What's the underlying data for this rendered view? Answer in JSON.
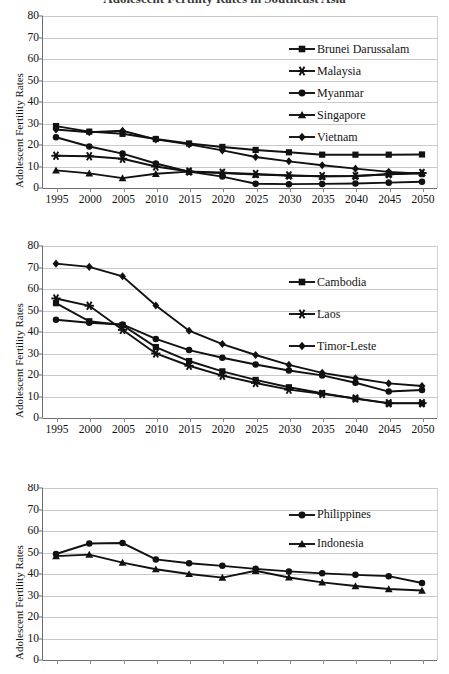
{
  "title": "Adolescent Fertility Rates in Southeast Asia",
  "axis": {
    "ylabel": "Adolescent Fertility Rates",
    "yticks": [
      0,
      10,
      20,
      30,
      40,
      50,
      60,
      70,
      80
    ],
    "ylim": [
      0,
      80
    ],
    "xticks": [
      "1995",
      "2000",
      "2005",
      "2010",
      "2015",
      "2020",
      "2025",
      "2030",
      "2035",
      "2040",
      "2045",
      "2050"
    ]
  },
  "chart_data": [
    {
      "id": "chart1",
      "type": "line",
      "title": "",
      "xlabel": "",
      "ylabel": "Adolescent Fertility Rates",
      "ylim": [
        0,
        80
      ],
      "grid": true,
      "legend_position": "upper-right",
      "x": [
        "1995",
        "2000",
        "2005",
        "2010",
        "2015",
        "2020",
        "2025",
        "2030",
        "2035",
        "2040",
        "2045",
        "2050"
      ],
      "x_axis_visible": true,
      "series": [
        {
          "name": "Brunei Darussalam",
          "marker": "square",
          "values": [
            28.8,
            26.2,
            25.2,
            22.8,
            20.7,
            19.1,
            17.7,
            16.6,
            15.5,
            15.5,
            15.5,
            15.6
          ]
        },
        {
          "name": "Malaysia",
          "marker": "asterisk",
          "values": [
            15.0,
            14.8,
            13.6,
            10.0,
            7.7,
            7.1,
            6.5,
            5.8,
            5.5,
            5.6,
            6.4,
            7.0
          ]
        },
        {
          "name": "Myanmar",
          "marker": "circle",
          "values": [
            23.6,
            19.3,
            16.0,
            11.4,
            7.6,
            5.3,
            2.0,
            1.8,
            1.9,
            2.1,
            2.5,
            2.9
          ]
        },
        {
          "name": "Singapore",
          "marker": "triangle",
          "values": [
            8.2,
            6.8,
            4.6,
            6.6,
            7.6,
            7.0,
            6.2,
            5.8,
            5.4,
            5.6,
            6.4,
            7.0
          ]
        },
        {
          "name": "Vietnam",
          "marker": "diamond",
          "values": [
            27.2,
            25.9,
            26.6,
            22.6,
            20.3,
            17.5,
            14.4,
            12.4,
            10.6,
            9.0,
            7.5,
            6.6
          ]
        }
      ]
    },
    {
      "id": "chart2",
      "type": "line",
      "title": "",
      "xlabel": "",
      "ylabel": "Adolescent Fertility Rates",
      "ylim": [
        0,
        80
      ],
      "grid": true,
      "legend_position": "upper-right",
      "x": [
        "1995",
        "2000",
        "2005",
        "2010",
        "2015",
        "2020",
        "2025",
        "2030",
        "2035",
        "2040",
        "2045",
        "2050"
      ],
      "x_axis_visible": true,
      "series": [
        {
          "name": "Cambodia",
          "marker": "square",
          "values": [
            53.4,
            45.0,
            43.2,
            33.0,
            26.5,
            21.7,
            17.7,
            14.3,
            11.5,
            9.0,
            6.8,
            6.8
          ]
        },
        {
          "name": "Laos",
          "marker": "asterisk",
          "values": [
            55.6,
            52.2,
            41.0,
            30.0,
            24.3,
            19.7,
            16.3,
            13.2,
            11.2,
            9.1,
            6.9,
            6.9
          ]
        },
        {
          "name": "Timor-Leste",
          "marker": "diamond",
          "values": [
            71.8,
            70.3,
            65.9,
            52.3,
            40.6,
            34.4,
            29.3,
            24.7,
            21.0,
            18.5,
            16.1,
            14.9
          ]
        },
        {
          "name": "Myanmar",
          "marker": "circle",
          "values": [
            45.7,
            44.3,
            43.5,
            36.8,
            31.6,
            28.0,
            24.9,
            22.1,
            19.8,
            16.4,
            12.3,
            13.0
          ]
        }
      ]
    },
    {
      "id": "chart3",
      "type": "line",
      "title": "",
      "xlabel": "",
      "ylabel": "Adolescent Fertility Rates",
      "ylim": [
        0,
        80
      ],
      "grid": true,
      "legend_position": "upper-right",
      "x": [
        "1995",
        "2000",
        "2005",
        "2010",
        "2015",
        "2020",
        "2025",
        "2030",
        "2035",
        "2040",
        "2045",
        "2050"
      ],
      "x_axis_visible": false,
      "series": [
        {
          "name": "Philippines",
          "marker": "circle",
          "values": [
            49.3,
            54.2,
            54.4,
            46.8,
            45.0,
            43.8,
            42.4,
            41.2,
            40.3,
            39.6,
            39.0,
            35.8
          ]
        },
        {
          "name": "Indonesia",
          "marker": "triangle",
          "values": [
            48.3,
            49.0,
            45.3,
            42.2,
            40.0,
            38.3,
            41.5,
            38.4,
            36.1,
            34.4,
            33.0,
            32.3
          ]
        }
      ]
    }
  ]
}
